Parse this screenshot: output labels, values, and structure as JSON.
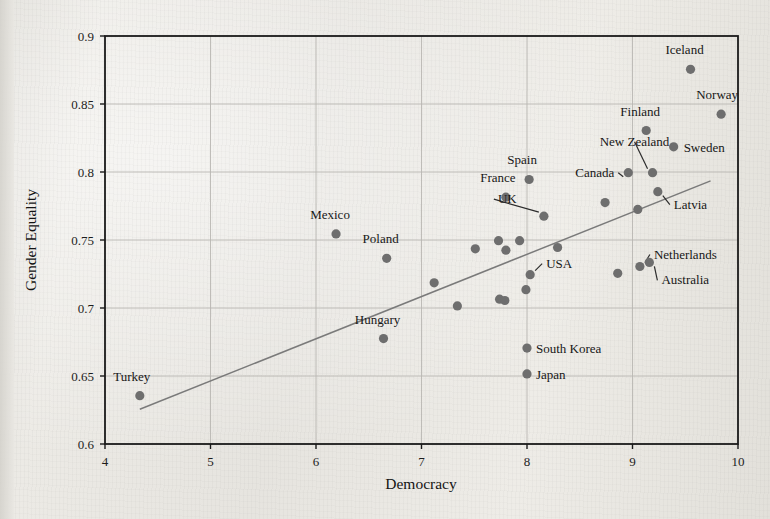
{
  "chart_data": {
    "type": "scatter",
    "title": "",
    "xlabel": "Democracy",
    "ylabel": "Gender Equality",
    "xlim": [
      4,
      10
    ],
    "ylim": [
      0.6,
      0.9
    ],
    "xticks": [
      "4",
      "5",
      "6",
      "7",
      "8",
      "9",
      "10"
    ],
    "xtick_values": [
      4,
      5,
      6,
      7,
      8,
      9,
      10
    ],
    "yticks": [
      "0.6",
      "0.65",
      "0.7",
      "0.75",
      "0.8",
      "0.85",
      "0.9"
    ],
    "ytick_values": [
      0.6,
      0.65,
      0.7,
      0.75,
      0.8,
      0.85,
      0.9
    ],
    "grid": true,
    "legend": "none",
    "marker_color": "#6e6e6e",
    "trendline_color": "#7a7a7a",
    "axis_color": "#1a1a1a",
    "grid_color": "#b9b7b2",
    "trendline": {
      "x0": 4.33,
      "y0": 0.6255,
      "x1": 9.74,
      "y1": 0.7935
    },
    "points": [
      {
        "label": "Turkey",
        "x": 4.33,
        "y": 0.6355,
        "lx": -8,
        "ly": -15,
        "anchor": "middle",
        "leader": false
      },
      {
        "label": "Mexico",
        "x": 6.19,
        "y": 0.7545,
        "lx": -6,
        "ly": -15,
        "anchor": "middle",
        "leader": false
      },
      {
        "label": "Poland",
        "x": 6.67,
        "y": 0.7365,
        "lx": -6,
        "ly": -15,
        "anchor": "middle",
        "leader": false
      },
      {
        "label": "Hungary",
        "x": 6.64,
        "y": 0.6775,
        "lx": -6,
        "ly": -15,
        "anchor": "middle",
        "leader": false
      },
      {
        "label": "France",
        "x": 7.8,
        "y": 0.7815,
        "lx": -8,
        "ly": -15,
        "anchor": "middle",
        "leader": false
      },
      {
        "label": "Spain",
        "x": 8.02,
        "y": 0.7945,
        "lx": -7,
        "ly": -15,
        "anchor": "middle",
        "leader": false
      },
      {
        "label": "UK",
        "x": 8.16,
        "y": 0.7675,
        "lx": -46,
        "ly": -13,
        "anchor": "start",
        "leader": true
      },
      {
        "label": "USA",
        "x": 8.03,
        "y": 0.7245,
        "lx": 16,
        "ly": -7,
        "anchor": "start",
        "leader": true
      },
      {
        "label": "Canada",
        "x": 8.96,
        "y": 0.7995,
        "lx": -14,
        "ly": 4,
        "anchor": "end",
        "leader": true
      },
      {
        "label": "New Zealand",
        "x": 9.19,
        "y": 0.7995,
        "lx": -18,
        "ly": -27,
        "anchor": "middle",
        "leader": true
      },
      {
        "label": "Finland",
        "x": 9.13,
        "y": 0.8305,
        "lx": -6,
        "ly": -15,
        "anchor": "middle",
        "leader": false
      },
      {
        "label": "Sweden",
        "x": 9.39,
        "y": 0.8185,
        "lx": 10,
        "ly": 5,
        "anchor": "start",
        "leader": false
      },
      {
        "label": "Norway",
        "x": 9.84,
        "y": 0.8425,
        "lx": -4,
        "ly": -15,
        "anchor": "middle",
        "leader": false
      },
      {
        "label": "Iceland",
        "x": 9.55,
        "y": 0.8755,
        "lx": -6,
        "ly": -15,
        "anchor": "middle",
        "leader": false
      },
      {
        "label": "Latvia",
        "x": 9.24,
        "y": 0.7855,
        "lx": 16,
        "ly": 17,
        "anchor": "start",
        "leader": true
      },
      {
        "label": "Netherlands",
        "x": 9.07,
        "y": 0.7305,
        "lx": 14,
        "ly": -8,
        "anchor": "start",
        "leader": true
      },
      {
        "label": "Australia",
        "x": 9.16,
        "y": 0.7335,
        "lx": 12,
        "ly": 22,
        "anchor": "start",
        "leader": true
      },
      {
        "label": "South Korea",
        "x": 8.0,
        "y": 0.6705,
        "lx": 9,
        "ly": 5,
        "anchor": "start",
        "leader": false
      },
      {
        "label": "Japan",
        "x": 8.0,
        "y": 0.6515,
        "lx": 9,
        "ly": 5,
        "anchor": "start",
        "leader": false
      },
      {
        "label": "",
        "x": 7.51,
        "y": 0.7435,
        "lx": 0,
        "ly": 0,
        "anchor": "start",
        "leader": false
      },
      {
        "label": "",
        "x": 7.73,
        "y": 0.7495,
        "lx": 0,
        "ly": 0,
        "anchor": "start",
        "leader": false
      },
      {
        "label": "",
        "x": 7.93,
        "y": 0.7495,
        "lx": 0,
        "ly": 0,
        "anchor": "start",
        "leader": false
      },
      {
        "label": "",
        "x": 8.29,
        "y": 0.7445,
        "lx": 0,
        "ly": 0,
        "anchor": "start",
        "leader": false
      },
      {
        "label": "",
        "x": 7.8,
        "y": 0.7425,
        "lx": 0,
        "ly": 0,
        "anchor": "start",
        "leader": false
      },
      {
        "label": "",
        "x": 7.12,
        "y": 0.7185,
        "lx": 0,
        "ly": 0,
        "anchor": "start",
        "leader": false
      },
      {
        "label": "",
        "x": 7.34,
        "y": 0.7015,
        "lx": 0,
        "ly": 0,
        "anchor": "start",
        "leader": false
      },
      {
        "label": "",
        "x": 7.74,
        "y": 0.7065,
        "lx": 0,
        "ly": 0,
        "anchor": "start",
        "leader": false
      },
      {
        "label": "",
        "x": 7.79,
        "y": 0.7055,
        "lx": 0,
        "ly": 0,
        "anchor": "start",
        "leader": false
      },
      {
        "label": "",
        "x": 7.99,
        "y": 0.7135,
        "lx": 0,
        "ly": 0,
        "anchor": "start",
        "leader": false
      },
      {
        "label": "",
        "x": 8.86,
        "y": 0.7255,
        "lx": 0,
        "ly": 0,
        "anchor": "start",
        "leader": false
      },
      {
        "label": "",
        "x": 8.74,
        "y": 0.7775,
        "lx": 0,
        "ly": 0,
        "anchor": "start",
        "leader": false
      },
      {
        "label": "",
        "x": 9.05,
        "y": 0.7725,
        "lx": 0,
        "ly": 0,
        "anchor": "start",
        "leader": false
      }
    ]
  }
}
